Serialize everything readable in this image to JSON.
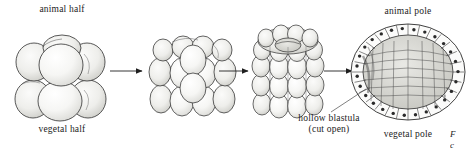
{
  "figure": {
    "type": "biological-line-diagram",
    "background_color": "#ffffff",
    "ink_color": "#1f1f1f",
    "cell_fill_color": "#f4f4f2",
    "cell_shade_color": "#d9d9d6",
    "nucleus_color": "#2a2a2a"
  },
  "labels": {
    "animal_half": "animal half",
    "vegetal_half": "vegetal half",
    "animal_pole": "animal pole",
    "vegetal_pole": "vegetal pole",
    "hollow_blastula": "hollow blastula (cut open)"
  },
  "caption": {
    "fragment_line1": "F",
    "fragment_line2": "c"
  },
  "stages": [
    {
      "index": 1,
      "name": "eight-cell-embryo",
      "description": "Eight-cell stage: two tiers of four rounded blastomeres",
      "tiers": 2,
      "cells_visible": 7
    },
    {
      "index": 2,
      "name": "morula-early",
      "description": "Early morula: three tiers of smaller rounded cells",
      "tiers": 3,
      "cells_visible": 17
    },
    {
      "index": 3,
      "name": "morula-late",
      "description": "Late morula: four tiers of cells with crown and central depression at the animal pole",
      "tiers": 4,
      "cells_visible": 28
    },
    {
      "index": 4,
      "name": "hollow-blastula",
      "description": "Hollow blastula shown cut open, single cell layer around a fluid-filled blastocoel",
      "rim_cells": 30,
      "nucleus_per_cell": 1
    }
  ],
  "arrows": [
    {
      "name": "arrow-stage1-to-stage2",
      "direction": "right"
    },
    {
      "name": "arrow-stage2-to-stage3",
      "direction": "right"
    },
    {
      "name": "arrow-stage3-to-stage4",
      "direction": "right"
    }
  ]
}
